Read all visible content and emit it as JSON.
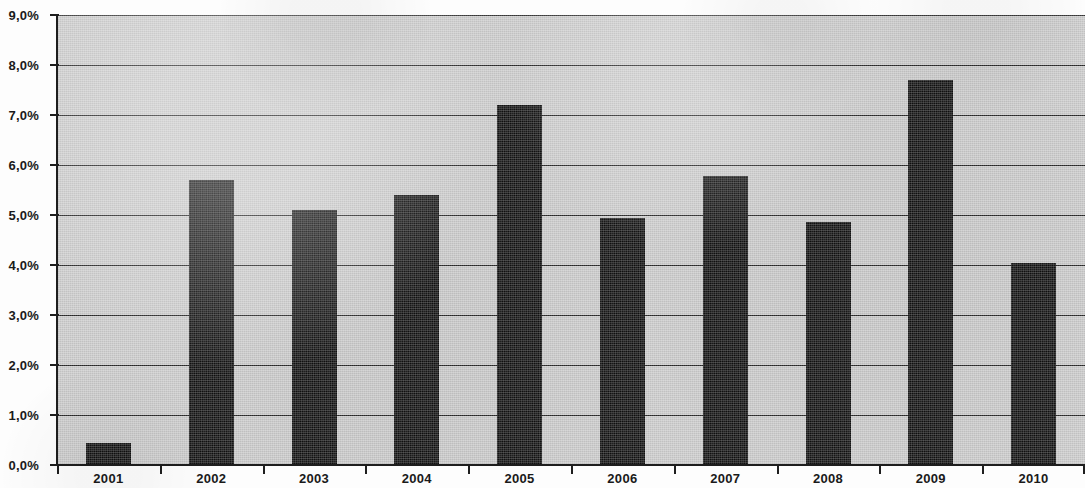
{
  "chart_data": {
    "type": "bar",
    "title": "",
    "subtitle": "",
    "xlabel": "",
    "ylabel": "",
    "categories": [
      "2001",
      "2002",
      "2003",
      "2004",
      "2005",
      "2006",
      "2007",
      "2008",
      "2009",
      "2010"
    ],
    "values": [
      0.45,
      5.7,
      5.1,
      5.4,
      7.2,
      4.95,
      5.78,
      4.87,
      7.7,
      4.05
    ],
    "value_labels": [
      "0,45%",
      "5,7%",
      "5,1%",
      "5,4%",
      "7,2%",
      "4,95%",
      "5,78%",
      "4,87%",
      "7,7%",
      "4,05%"
    ],
    "ylim": [
      0,
      9
    ],
    "ytick_values": [
      0,
      1,
      2,
      3,
      4,
      5,
      6,
      7,
      8,
      9
    ],
    "ytick_labels": [
      "0,0%",
      "1,0%",
      "2,0%",
      "3,0%",
      "4,0%",
      "5,0%",
      "6,0%",
      "7,0%",
      "8,0%",
      "9,0%"
    ],
    "decimal_separator": ",",
    "unit": "%",
    "grid": true,
    "grid_axis": "y",
    "legend": false,
    "legend_position": "none",
    "series": [
      {
        "name": "",
        "values": [
          0.45,
          5.7,
          5.1,
          5.4,
          7.2,
          4.95,
          5.78,
          4.87,
          7.7,
          4.05
        ]
      }
    ],
    "colors": {
      "bar": "#111111",
      "plot_background": "#cdcdcd",
      "gridline": "#2b2b2b",
      "axis": "#1e1e1e",
      "tick_label": "#1a1a1a",
      "page_background": "#fdfdfd"
    }
  }
}
